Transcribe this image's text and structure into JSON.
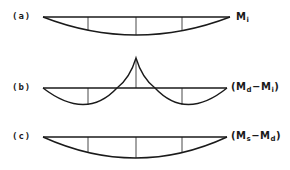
{
  "diagrams": [
    {
      "id": "a",
      "label": "(a)",
      "moment_name": "M",
      "moment_sub": "i",
      "name_prefix": "",
      "name_suffix": ""
    },
    {
      "id": "b",
      "label": "(b)",
      "name_prefix": "(",
      "m1": "M",
      "m1_sub": "d",
      "op": "−",
      "m2": "M",
      "m2_sub": "i",
      "name_suffix": ")"
    },
    {
      "id": "c",
      "label": "(c)",
      "name_prefix": "(",
      "m1": "M",
      "m1_sub": "s",
      "op": "−",
      "m2": "M",
      "m2_sub": "d",
      "name_suffix": ")"
    }
  ],
  "colors": {
    "stroke": "#1a1a1a",
    "background": "#ffffff"
  }
}
